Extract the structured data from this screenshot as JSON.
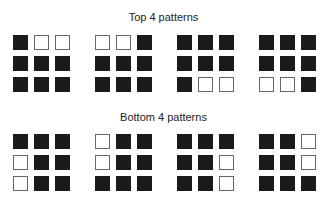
{
  "sections": [
    {
      "title": "Top 4 patterns",
      "patterns": [
        [
          [
            1,
            0,
            0
          ],
          [
            1,
            1,
            1
          ],
          [
            1,
            1,
            1
          ]
        ],
        [
          [
            0,
            0,
            1
          ],
          [
            1,
            1,
            1
          ],
          [
            1,
            1,
            1
          ]
        ],
        [
          [
            1,
            1,
            1
          ],
          [
            1,
            1,
            1
          ],
          [
            1,
            0,
            0
          ]
        ],
        [
          [
            1,
            1,
            1
          ],
          [
            1,
            1,
            1
          ],
          [
            0,
            0,
            1
          ]
        ]
      ]
    },
    {
      "title": "Bottom 4 patterns",
      "patterns": [
        [
          [
            1,
            1,
            1
          ],
          [
            0,
            1,
            1
          ],
          [
            0,
            1,
            1
          ]
        ],
        [
          [
            0,
            1,
            1
          ],
          [
            0,
            1,
            1
          ],
          [
            1,
            1,
            1
          ]
        ],
        [
          [
            1,
            1,
            1
          ],
          [
            1,
            1,
            0
          ],
          [
            1,
            1,
            0
          ]
        ],
        [
          [
            1,
            1,
            0
          ],
          [
            1,
            1,
            0
          ],
          [
            1,
            1,
            1
          ]
        ]
      ]
    }
  ],
  "colors": {
    "filled": "#1b1b1b",
    "empty_border": "#666666",
    "background": "#ffffff"
  }
}
